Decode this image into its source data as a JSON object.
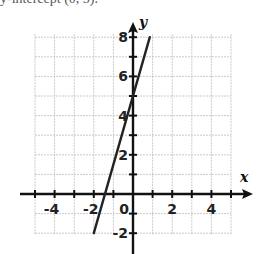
{
  "header": {
    "cut_off_text": "y-intercept (0, 5)."
  },
  "chart_data": {
    "type": "line",
    "title": "",
    "xlabel": "x",
    "ylabel": "y",
    "xlim": [
      -5,
      5
    ],
    "ylim": [
      -2,
      8
    ],
    "grid": true,
    "legend": null,
    "x_tick_labels": [
      "-4",
      "-2",
      "0",
      "2",
      "4"
    ],
    "y_tick_labels": [
      "8",
      "6",
      "4",
      "2",
      "-2"
    ],
    "series": [
      {
        "name": "line",
        "equation": "y = 3.5x + 5",
        "x": [
          -2,
          0.857
        ],
        "y": [
          -2,
          8
        ],
        "y_intercept": 5,
        "x_intercept": -1.43,
        "color": "#222222"
      }
    ]
  },
  "colors": {
    "axis": "#111111",
    "grid": "#bdbdbd",
    "line": "#222222"
  }
}
